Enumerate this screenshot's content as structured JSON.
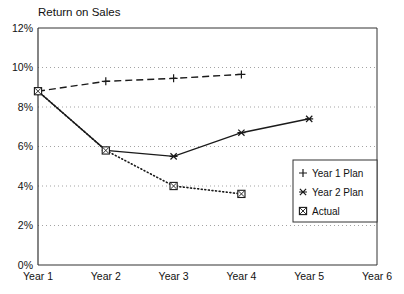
{
  "chart_data": {
    "type": "line",
    "title": "Return on Sales",
    "xlabel": "",
    "ylabel": "",
    "categories": [
      "Year 1",
      "Year 2",
      "Year 3",
      "Year 4",
      "Year 5",
      "Year 6"
    ],
    "ylim": [
      0,
      12
    ],
    "yticks": [
      "0%",
      "2%",
      "4%",
      "6%",
      "8%",
      "10%",
      "12%"
    ],
    "ytick_values": [
      0,
      2,
      4,
      6,
      8,
      10,
      12
    ],
    "grid": true,
    "legend_position": "lower-right",
    "series": [
      {
        "name": "Year 1 Plan",
        "marker": "plus",
        "line_style": "dashed",
        "x": [
          "Year 1",
          "Year 2",
          "Year 3",
          "Year 4"
        ],
        "values": [
          8.8,
          9.3,
          9.45,
          9.65
        ]
      },
      {
        "name": "Year 2 Plan",
        "marker": "asterisk",
        "line_style": "solid",
        "x": [
          "Year 1",
          "Year 2",
          "Year 3",
          "Year 4",
          "Year 5"
        ],
        "values": [
          8.8,
          5.8,
          5.5,
          6.7,
          7.4
        ]
      },
      {
        "name": "Actual",
        "marker": "boxed-x",
        "line_style": "dotted",
        "x": [
          "Year 1",
          "Year 2",
          "Year 3",
          "Year 4"
        ],
        "values": [
          8.8,
          5.8,
          4.0,
          3.6
        ]
      }
    ]
  },
  "legend": {
    "items": [
      {
        "label": "Year 1 Plan",
        "marker": "plus"
      },
      {
        "label": "Year 2 Plan",
        "marker": "asterisk"
      },
      {
        "label": "Actual",
        "marker": "boxed-x"
      }
    ]
  },
  "colors": {
    "axis": "#333333",
    "grid": "#999999",
    "series": "#1a1a1a",
    "background": "#ffffff"
  }
}
